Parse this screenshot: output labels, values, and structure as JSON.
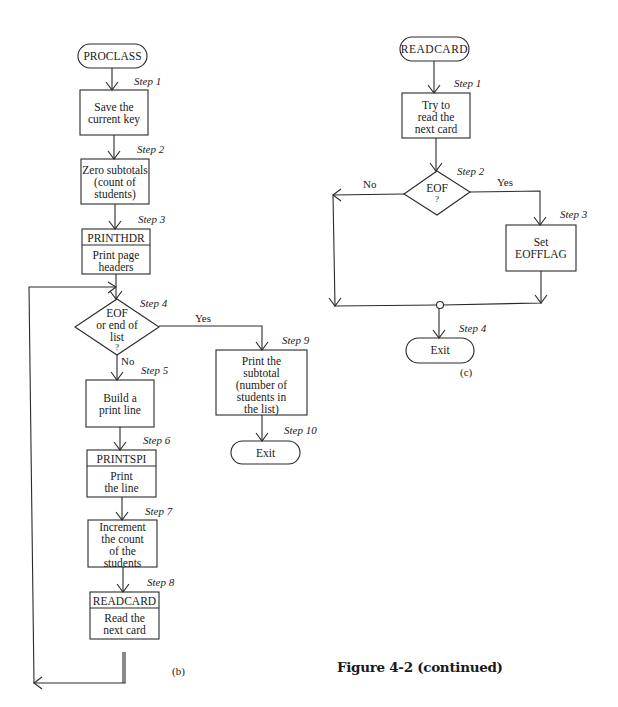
{
  "figure_caption": "Figure 4-2 (continued)",
  "diagram_b": {
    "caption": "(b)",
    "start": "PROCLASS",
    "steps": [
      {
        "step": "Step 1",
        "text": [
          "Save the",
          "current key"
        ]
      },
      {
        "step": "Step 2",
        "text": [
          "Zero subtotals",
          "(count of",
          "students)"
        ]
      },
      {
        "step": "Step 3",
        "header": "PRINTHDR",
        "text": [
          "Print page",
          "headers"
        ]
      },
      {
        "step": "Step 4",
        "decision": [
          "EOF",
          "or end of",
          "list",
          "?"
        ],
        "yes": "Yes",
        "no": "No"
      },
      {
        "step": "Step 5",
        "text": [
          "Build a",
          "print line"
        ]
      },
      {
        "step": "Step 6",
        "header": "PRINTSPI",
        "text": [
          "Print",
          "the line"
        ]
      },
      {
        "step": "Step 7",
        "text": [
          "Increment",
          "the count",
          "of the",
          "students"
        ]
      },
      {
        "step": "Step 8",
        "header": "READCARD",
        "text": [
          "Read the",
          "next card"
        ]
      },
      {
        "step": "Step 9",
        "text": [
          "Print the",
          "subtotal",
          "(number of",
          "students in",
          "the list)"
        ]
      },
      {
        "step": "Step 10",
        "terminal": "Exit"
      }
    ]
  },
  "diagram_c": {
    "caption": "(c)",
    "start": "READCARD",
    "steps": [
      {
        "step": "Step 1",
        "text": [
          "Try to",
          "read the",
          "next card"
        ]
      },
      {
        "step": "Step 2",
        "decision": [
          "EOF",
          "?"
        ],
        "yes": "Yes",
        "no": "No"
      },
      {
        "step": "Step 3",
        "text": [
          "Set",
          "EOFFLAG"
        ]
      },
      {
        "step": "Step 4",
        "terminal": "Exit"
      }
    ]
  }
}
